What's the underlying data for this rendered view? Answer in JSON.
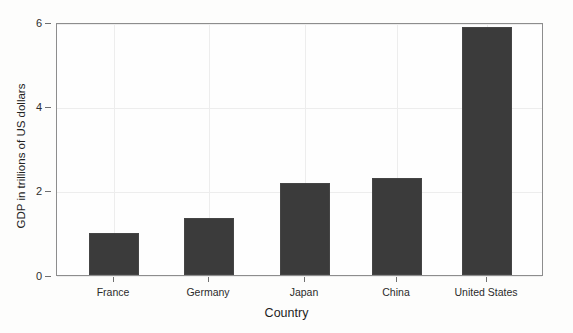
{
  "chart_data": {
    "type": "bar",
    "title": "",
    "subtitle": "",
    "xlabel": "Country",
    "ylabel": "GDP in trillions of US dollars",
    "categories": [
      "France",
      "Germany",
      "Japan",
      "China",
      "United States"
    ],
    "values": [
      1.0,
      1.35,
      2.18,
      2.3,
      5.88
    ],
    "ylim": [
      0,
      6
    ],
    "yticks": [
      0,
      2,
      4,
      6
    ],
    "ytick_labels": [
      "0",
      "2",
      "4",
      "6"
    ],
    "grid": true,
    "legend": null,
    "bar_color": "#3b3b3b",
    "background_color": "#fdfdfc",
    "axis_color": "#8d8d8d"
  },
  "axes": {
    "y_title": "GDP in trillions of US dollars",
    "x_title": "Country"
  }
}
